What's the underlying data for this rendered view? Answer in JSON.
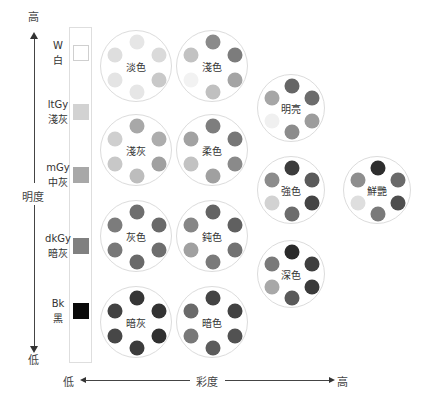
{
  "lightness_axis": {
    "label": "明度",
    "top": "高",
    "bottom": "低"
  },
  "chroma_axis": {
    "label": "彩度",
    "left": "低",
    "right": "高"
  },
  "gray_scale": [
    {
      "code": "W",
      "name": "白",
      "color": "#ffffff",
      "y": 45
    },
    {
      "code": "ltGy",
      "name": "淺灰",
      "color": "#d2d2d2",
      "y": 104
    },
    {
      "code": "mGy",
      "name": "中灰",
      "color": "#a8a8a8",
      "y": 167
    },
    {
      "code": "dkGy",
      "name": "暗灰",
      "color": "#808080",
      "y": 238
    },
    {
      "code": "Bk",
      "name": "黑",
      "color": "#0a0a0a",
      "y": 303
    }
  ],
  "tones": [
    {
      "name": "淡色",
      "cx": 136,
      "cy": 66,
      "r": 36,
      "dots": [
        "#e6e6e6",
        "#dadada",
        "#dedede",
        "#c9c9c9",
        "#e4e4e4",
        "#e6e6e6"
      ]
    },
    {
      "name": "淺色",
      "cx": 212,
      "cy": 66,
      "r": 36,
      "dots": [
        "#8a8a8a",
        "#7c7c7c",
        "#c2c2c2",
        "#a4a4a4",
        "#f2f2f2",
        "#c0c0c0"
      ]
    },
    {
      "name": "淺灰",
      "cx": 136,
      "cy": 150,
      "r": 36,
      "dots": [
        "#a8a8a8",
        "#adadad",
        "#cfcfcf",
        "#a0a0a0",
        "#c8c8c8",
        "#bdbdbd"
      ]
    },
    {
      "name": "柔色",
      "cx": 212,
      "cy": 150,
      "r": 36,
      "dots": [
        "#7e7e7e",
        "#777777",
        "#a2a2a2",
        "#8a8a8a",
        "#c2c2c2",
        "#a0a0a0"
      ]
    },
    {
      "name": "灰色",
      "cx": 136,
      "cy": 236,
      "r": 36,
      "dots": [
        "#6e6e6e",
        "#6a6a6a",
        "#7c7c7c",
        "#6e6e6e",
        "#787878",
        "#696969"
      ]
    },
    {
      "name": "鈍色",
      "cx": 212,
      "cy": 236,
      "r": 36,
      "dots": [
        "#646464",
        "#606060",
        "#868686",
        "#727272",
        "#a0a0a0",
        "#7a7a7a"
      ]
    },
    {
      "name": "暗灰",
      "cx": 136,
      "cy": 322,
      "r": 36,
      "dots": [
        "#363636",
        "#333333",
        "#424242",
        "#303030",
        "#474747",
        "#3c3c3c"
      ]
    },
    {
      "name": "暗色",
      "cx": 212,
      "cy": 322,
      "r": 36,
      "dots": [
        "#444444",
        "#424242",
        "#6a6a6a",
        "#525252",
        "#787878",
        "#5c5c5c"
      ]
    },
    {
      "name": "明亮",
      "cx": 291,
      "cy": 108,
      "r": 34,
      "dots": [
        "#666666",
        "#6c6c6c",
        "#a6a6a6",
        "#9c9c9c",
        "#f0f0f0",
        "#8c8c8c"
      ]
    },
    {
      "name": "強色",
      "cx": 291,
      "cy": 190,
      "r": 34,
      "dots": [
        "#3c3c3c",
        "#5a5a5a",
        "#8c8c8c",
        "#444444",
        "#d2d2d2",
        "#6c6c6c"
      ]
    },
    {
      "name": "鮮艷",
      "cx": 377,
      "cy": 190,
      "r": 34,
      "dots": [
        "#2e2e2e",
        "#6a6a6a",
        "#8e8e8e",
        "#4e4e4e",
        "#dedede",
        "#7a7a7a"
      ]
    },
    {
      "name": "深色",
      "cx": 291,
      "cy": 274,
      "r": 34,
      "dots": [
        "#2a2a2a",
        "#3e3e3e",
        "#7a7a7a",
        "#3a3a3a",
        "#a8a8a8",
        "#5a5a5a"
      ]
    }
  ]
}
